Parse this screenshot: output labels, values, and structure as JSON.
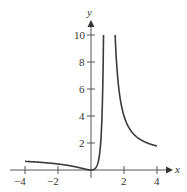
{
  "chart_data": {
    "type": "line",
    "title": "",
    "xlabel": "x",
    "ylabel": "y",
    "xlim": [
      -4,
      4
    ],
    "ylim": [
      0,
      10
    ],
    "x_ticks": [
      "-4",
      "-2",
      "0",
      "2",
      "4"
    ],
    "y_ticks": [
      "2",
      "4",
      "6",
      "8",
      "10"
    ],
    "grid": false,
    "legend": null,
    "vertical_asymptote": 1,
    "function": "y = x^2/(x-1)^2",
    "series": [
      {
        "name": "left branch",
        "x": [
          -4,
          -3,
          -2,
          -1,
          -0.5,
          0,
          0.25,
          0.5,
          0.6,
          0.7,
          0.76
        ],
        "values": [
          0.64,
          0.56,
          0.44,
          0.25,
          0.11,
          0,
          0.11,
          1,
          2.25,
          5.44,
          10
        ]
      },
      {
        "name": "right branch",
        "x": [
          1.46,
          1.6,
          1.8,
          2,
          2.5,
          3,
          3.5,
          4
        ],
        "values": [
          10,
          7.1,
          5.06,
          4,
          2.78,
          2.25,
          1.96,
          1.78
        ]
      }
    ],
    "color": "#3a3a3a"
  },
  "labels": {
    "x_axis": "x",
    "y_axis": "y",
    "x_ticks": [
      "−4",
      "−2",
      "2",
      "4"
    ],
    "y_ticks": [
      "10",
      "8",
      "6",
      "4",
      "2"
    ]
  }
}
